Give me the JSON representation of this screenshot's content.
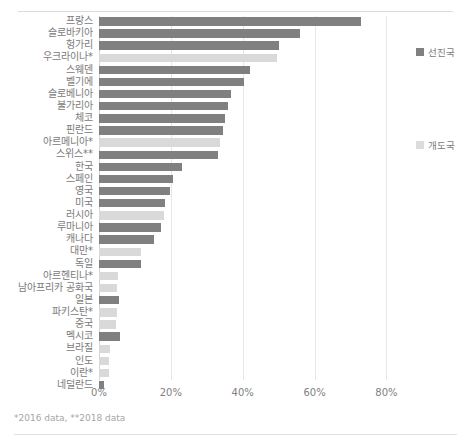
{
  "chart_data": {
    "type": "bar",
    "orientation": "horizontal",
    "title": "",
    "xlabel": "",
    "ylabel": "",
    "xlim": [
      0,
      86
    ],
    "xticks": [
      "0%",
      "20%",
      "40%",
      "60%",
      "80%"
    ],
    "xtick_values": [
      0,
      20,
      40,
      60,
      80
    ],
    "grid": true,
    "legend_position": "right",
    "series": [
      {
        "name": "선진국",
        "key": "dev",
        "color": "#808080"
      },
      {
        "name": "개도국",
        "key": "ing",
        "color": "#d9d9d9"
      }
    ],
    "categories": [
      "프랑스",
      "슬로바키아",
      "헝가리",
      "우크라이나*",
      "스웨덴",
      "벨기에",
      "슬로베니아",
      "불가리아",
      "체코",
      "핀란드",
      "아르메니아*",
      "스위스**",
      "한국",
      "스페인",
      "영국",
      "미국",
      "러시아",
      "루마니아",
      "캐나다",
      "대만*",
      "독일",
      "아르헨티나*",
      "남아프리카 공화국",
      "일본",
      "파키스탄*",
      "중국",
      "멕시코",
      "브라질",
      "인도",
      "이란*",
      "네덜란드"
    ],
    "bars": [
      {
        "label": "프랑스",
        "value": 73.0,
        "group": "dev"
      },
      {
        "label": "슬로바키아",
        "value": 56.0,
        "group": "dev"
      },
      {
        "label": "헝가리",
        "value": 50.0,
        "group": "dev"
      },
      {
        "label": "우크라이나*",
        "value": 49.5,
        "group": "ing"
      },
      {
        "label": "스웨덴",
        "value": 42.0,
        "group": "dev"
      },
      {
        "label": "벨기에",
        "value": 40.3,
        "group": "dev"
      },
      {
        "label": "슬로베니아",
        "value": 36.8,
        "group": "dev"
      },
      {
        "label": "불가리아",
        "value": 36.0,
        "group": "dev"
      },
      {
        "label": "체코",
        "value": 35.0,
        "group": "dev"
      },
      {
        "label": "핀란드",
        "value": 34.5,
        "group": "dev"
      },
      {
        "label": "아르메니아*",
        "value": 33.8,
        "group": "ing"
      },
      {
        "label": "스위스**",
        "value": 33.0,
        "group": "dev"
      },
      {
        "label": "한국",
        "value": 23.0,
        "group": "dev"
      },
      {
        "label": "스페인",
        "value": 20.6,
        "group": "dev"
      },
      {
        "label": "영국",
        "value": 19.7,
        "group": "dev"
      },
      {
        "label": "미국",
        "value": 18.5,
        "group": "dev"
      },
      {
        "label": "러시아",
        "value": 18.2,
        "group": "ing"
      },
      {
        "label": "루마니아",
        "value": 17.2,
        "group": "dev"
      },
      {
        "label": "캐나다",
        "value": 15.3,
        "group": "dev"
      },
      {
        "label": "대만*",
        "value": 11.6,
        "group": "ing"
      },
      {
        "label": "독일",
        "value": 11.7,
        "group": "dev"
      },
      {
        "label": "아르헨티나*",
        "value": 5.2,
        "group": "ing"
      },
      {
        "label": "남아프리카 공화국",
        "value": 5.1,
        "group": "ing"
      },
      {
        "label": "일본",
        "value": 5.6,
        "group": "dev"
      },
      {
        "label": "파키스탄*",
        "value": 5.0,
        "group": "ing"
      },
      {
        "label": "중국",
        "value": 4.7,
        "group": "ing"
      },
      {
        "label": "멕시코",
        "value": 5.8,
        "group": "dev"
      },
      {
        "label": "브라질",
        "value": 3.0,
        "group": "ing"
      },
      {
        "label": "인도",
        "value": 2.9,
        "group": "ing"
      },
      {
        "label": "이란*",
        "value": 2.8,
        "group": "ing"
      },
      {
        "label": "네덜란드",
        "value": 1.4,
        "group": "dev"
      }
    ]
  },
  "legend": {
    "developed_label": "선진국",
    "developing_label": "개도국"
  },
  "footnote": {
    "text": "*2016 data, **2018 data"
  }
}
